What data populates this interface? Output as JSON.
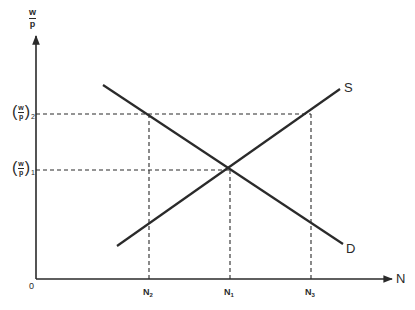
{
  "diagram": {
    "type": "supply-demand labor market",
    "y_axis": {
      "label_num": "w",
      "label_den": "p"
    },
    "x_axis": {
      "label": "N"
    },
    "origin_label": "0",
    "curves": [
      {
        "name": "Supply",
        "label": "S"
      },
      {
        "name": "Demand",
        "label": "D"
      }
    ],
    "y_levels": [
      {
        "id": "wp2",
        "num": "w",
        "den": "p",
        "sub": "2"
      },
      {
        "id": "wp1",
        "num": "w",
        "den": "p",
        "sub": "1"
      }
    ],
    "x_levels": [
      {
        "id": "N2",
        "base": "N",
        "sub": "2"
      },
      {
        "id": "N1",
        "base": "N",
        "sub": "1"
      },
      {
        "id": "N3",
        "base": "N",
        "sub": "3"
      }
    ]
  },
  "colors": {
    "ink": "#2a2a2a",
    "background": "#ffffff"
  }
}
